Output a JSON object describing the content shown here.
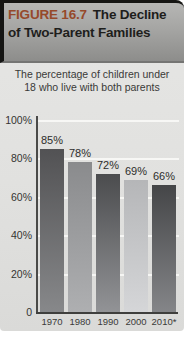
{
  "figure": {
    "label": "FIGURE 16.7",
    "title": "The Decline of Two-Parent Families",
    "subtitle": "The percentage of children under 18 who live with both parents"
  },
  "colors": {
    "figure_label_accent": "#96492a",
    "header_gradient_top": "#b6b6b4",
    "header_gradient_bottom": "#8d8d8b",
    "body_background": "#e1e1df",
    "axis": "#4a4a48",
    "gridline": "#fafaf8"
  },
  "chart_data": {
    "type": "bar",
    "title": "The Decline of Two-Parent Families",
    "xlabel": "",
    "ylabel": "",
    "ylim": [
      0,
      100
    ],
    "grid": true,
    "categories": [
      "1970",
      "1980",
      "1990",
      "2000",
      "2010*"
    ],
    "values": [
      85,
      78,
      72,
      69,
      66
    ],
    "y_ticks": [
      {
        "label": "100%",
        "value": 100
      },
      {
        "label": "80%",
        "value": 80
      },
      {
        "label": "60%",
        "value": 60
      },
      {
        "label": "40%",
        "value": 40
      },
      {
        "label": "20%",
        "value": 20
      },
      {
        "label": "0",
        "value": 0
      }
    ],
    "bars": [
      {
        "year": "1970",
        "value": 85,
        "label": "85%",
        "color_top": "#525254",
        "color_bottom": "#87888a"
      },
      {
        "year": "1980",
        "value": 78,
        "label": "78%",
        "color_top": "#8a8b8d",
        "color_bottom": "#aeafb1"
      },
      {
        "year": "1990",
        "value": 72,
        "label": "72%",
        "color_top": "#4b4c4e",
        "color_bottom": "#929396"
      },
      {
        "year": "2000",
        "value": 69,
        "label": "69%",
        "color_top": "#b5b6b8",
        "color_bottom": "#d5d6d8"
      },
      {
        "year": "2010*",
        "value": 66,
        "label": "66%",
        "color_top": "#454648",
        "color_bottom": "#848588"
      }
    ]
  }
}
